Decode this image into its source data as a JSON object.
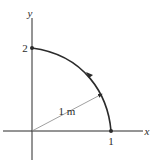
{
  "diagram": {
    "axes": {
      "x_label": "x",
      "y_label": "y"
    },
    "tick_labels": {
      "x_one": "1",
      "y_two": "2"
    },
    "radius_label": "1 m",
    "points": [
      {
        "name": "point-on-x-axis",
        "label": "1"
      },
      {
        "name": "point-on-y-axis",
        "label": "2"
      }
    ],
    "curve": {
      "description": "arc from (1,0) to (0,2) with counter-clockwise direction arrow"
    },
    "colors": {
      "line": "#2b2b2b",
      "radius_line": "#888888",
      "background": "#ffffff"
    }
  }
}
